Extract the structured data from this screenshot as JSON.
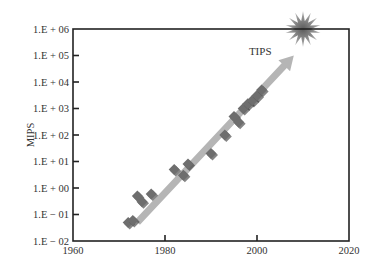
{
  "chart_data": {
    "type": "scatter",
    "title": "",
    "xlabel": "",
    "ylabel": "MIPS",
    "xlim": [
      1960,
      2020
    ],
    "ylim": [
      0.01,
      1000000
    ],
    "yscale": "log",
    "grid": false,
    "legend": null,
    "x_ticks": [
      "1960",
      "1980",
      "2000",
      "2020"
    ],
    "x_tick_values": [
      1960,
      1980,
      2000,
      2020
    ],
    "y_ticks": [
      "1.E + 06",
      "1.E + 05",
      "1.E + 04",
      "1.E + 03",
      "1.E + 02",
      "1.E + 01",
      "1.E + 00",
      "1.E − 01",
      "1.E − 02"
    ],
    "y_tick_exponents": [
      6,
      5,
      4,
      3,
      2,
      1,
      0,
      -1,
      -2
    ],
    "series": [
      {
        "name": "processors",
        "marker": "diamond",
        "color": "#6e6e6e",
        "points": [
          {
            "x": 1972,
            "y": 0.05
          },
          {
            "x": 1973,
            "y": 0.06
          },
          {
            "x": 1974,
            "y": 0.5
          },
          {
            "x": 1975,
            "y": 0.3
          },
          {
            "x": 1977,
            "y": 0.6
          },
          {
            "x": 1982,
            "y": 5
          },
          {
            "x": 1984,
            "y": 3
          },
          {
            "x": 1985,
            "y": 8
          },
          {
            "x": 1990,
            "y": 20
          },
          {
            "x": 1993,
            "y": 100
          },
          {
            "x": 1995,
            "y": 500
          },
          {
            "x": 1996,
            "y": 300
          },
          {
            "x": 1997,
            "y": 1000
          },
          {
            "x": 1998,
            "y": 1500
          },
          {
            "x": 1999,
            "y": 2000
          },
          {
            "x": 2000,
            "y": 3000
          },
          {
            "x": 2001,
            "y": 5000
          }
        ]
      }
    ],
    "trend_arrow": {
      "color": "#b5b5b5",
      "from": {
        "x": 1974,
        "y": 0.05
      },
      "to": {
        "x": 2008,
        "y": 100000
      }
    },
    "annotations": [
      {
        "text": "TIPS",
        "x": 2002,
        "y": 150000
      },
      {
        "type": "starburst",
        "x": 2010,
        "y": 1000000,
        "color": "#8a8a8a"
      }
    ]
  }
}
